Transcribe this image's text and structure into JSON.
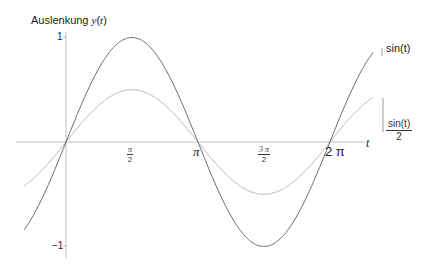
{
  "chart_data": {
    "type": "line",
    "title": "",
    "ylabel": "Auslenkung y(t)",
    "xlabel": "t",
    "xlim": [
      -1.0,
      7.31
    ],
    "ylim": [
      -1.1,
      1.1
    ],
    "grid": false,
    "x_ticks": [
      {
        "value": 1.5708,
        "label": "π/2"
      },
      {
        "value": 3.1416,
        "label": "π"
      },
      {
        "value": 4.7124,
        "label": "3π/2"
      },
      {
        "value": 6.2832,
        "label": "2π"
      }
    ],
    "y_ticks": [
      {
        "value": 1,
        "label": "1"
      },
      {
        "value": -1,
        "label": "−1"
      }
    ],
    "series": [
      {
        "name": "sin(t)",
        "function": "sin(t)",
        "color": "#6b6b6b",
        "amplitude": 1
      },
      {
        "name": "sin(t)/2",
        "function": "sin(t)/2",
        "color": "#b8b8b8",
        "amplitude": 0.5
      }
    ],
    "legend_position": "right, inline labels at curve ends"
  },
  "labels": {
    "ylabel_prefix": "Auslenkung ",
    "ylabel_var": "y",
    "ylabel_paren_open": "(",
    "ylabel_arg": "t",
    "ylabel_paren_close": ")",
    "xlabel": "t",
    "ytick_pos": "1",
    "ytick_neg": "−1",
    "xtick_pi_half_num": "π",
    "xtick_pi_half_den": "2",
    "xtick_pi": "π",
    "xtick_3pi_half_num": "3 π",
    "xtick_3pi_half_den": "2",
    "xtick_2pi": "2 π",
    "legend_sin": "sin(t)",
    "legend_half_num": "sin(t)",
    "legend_half_den": "2"
  }
}
